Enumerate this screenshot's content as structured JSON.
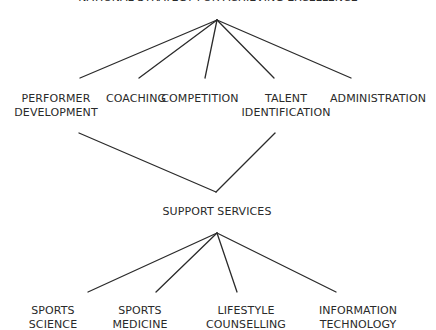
{
  "title": "NATIONAL STRATEGY FOR ACHIEVING EXCELLENCE",
  "top_level": [
    {
      "line1": "PERFORMER",
      "line2": "DEVELOPMENT"
    },
    {
      "line1": "COACHING",
      "line2": ""
    },
    {
      "line1": "COMPETITION",
      "line2": ""
    },
    {
      "line1": "TALENT",
      "line2": "IDENTIFICATION"
    },
    {
      "line1": "ADMINISTRATION",
      "line2": ""
    }
  ],
  "middle": {
    "label": "SUPPORT SERVICES"
  },
  "support_services": [
    {
      "line1": "SPORTS",
      "line2": "SCIENCE"
    },
    {
      "line1": "SPORTS",
      "line2": "MEDICINE"
    },
    {
      "line1": "LIFESTYLE",
      "line2": "COUNSELLING"
    },
    {
      "line1": "INFORMATION",
      "line2": "TECHNOLOGY"
    }
  ]
}
